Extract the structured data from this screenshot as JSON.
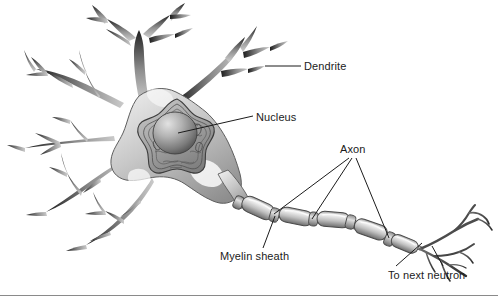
{
  "figure": {
    "background_color": "#ffffff",
    "rule_color": "#8a8a8a"
  },
  "labels": {
    "dendrite": "Dendrite",
    "nucleus": "Nucleus",
    "axon": "Axon",
    "myelin_sheath": "Myelin sheath",
    "to_next_neutron": "To next neutron"
  },
  "palette": {
    "outline": "#2b2b2b",
    "soma_light": "#e6e6e6",
    "soma_mid": "#b9b9b9",
    "soma_dark": "#7d7d7d",
    "dendrite_tip": "#1f1f1f",
    "dendrite_base": "#c2c2c2",
    "nucleus_fill": "#9a9a9a",
    "nucleolus_light": "#d9d9d9",
    "nucleolus_dark": "#4a4a4a",
    "myelin_light": "#efefef",
    "myelin_mid": "#b0b0b0",
    "myelin_dark": "#6f6f6f",
    "leader_line": "#1b1b1b",
    "text": "#1b1b1b"
  },
  "parts": {
    "dendrites_label_name": "dendrite-branches",
    "soma_label_name": "cell-body-soma",
    "nucleus_label_name": "nucleus-body",
    "nucleolus_label_name": "nucleolus",
    "axon_label_name": "axon-fiber",
    "myelin_label_name": "myelin-segments",
    "terminal_label_name": "axon-terminals"
  },
  "myelin_segments": [
    {
      "index": 1,
      "x": 243,
      "y": 205,
      "angle": 24
    },
    {
      "index": 2,
      "x": 277,
      "y": 216,
      "angle": 14
    },
    {
      "index": 3,
      "x": 312,
      "y": 220,
      "angle": 4
    },
    {
      "index": 4,
      "x": 348,
      "y": 224,
      "angle": 12
    },
    {
      "index": 5,
      "x": 382,
      "y": 236,
      "angle": 22
    }
  ]
}
